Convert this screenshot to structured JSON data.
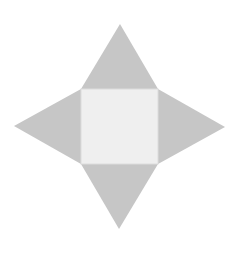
{
  "diagram": {
    "colors": {
      "background": "#ffffff",
      "triangle_fill": "#c6c6c6",
      "square_fill": "#efefef",
      "square_stroke": "#dcdcdc"
    },
    "square": {
      "x": 81,
      "y": 89,
      "width": 77,
      "height": 75
    },
    "triangles": [
      {
        "name": "top",
        "points": "81,89 158,89 120,24"
      },
      {
        "name": "right",
        "points": "158,89 158,164 225,127"
      },
      {
        "name": "bottom",
        "points": "81,164 158,164 119,229"
      },
      {
        "name": "left",
        "points": "81,89 81,164 14,126"
      }
    ]
  }
}
